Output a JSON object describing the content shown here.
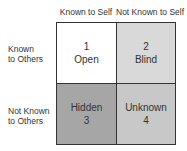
{
  "columns": [
    "Known to Self",
    "Not Known to Self"
  ],
  "rows": [
    {
      "line1": "Known",
      "line2": "to Others"
    },
    {
      "line1": "Not Known",
      "line2": "to Others"
    }
  ],
  "cells": [
    {
      "top": "1",
      "bottom": "Open",
      "color": "#ffffff"
    },
    {
      "top": "2",
      "bottom": "Blind",
      "color": "#d9d9d9"
    },
    {
      "top": "Hidden",
      "bottom": "3",
      "color": "#a6a6a6"
    },
    {
      "top": "Unknown",
      "bottom": "4",
      "color": "#c8c8c8"
    }
  ]
}
